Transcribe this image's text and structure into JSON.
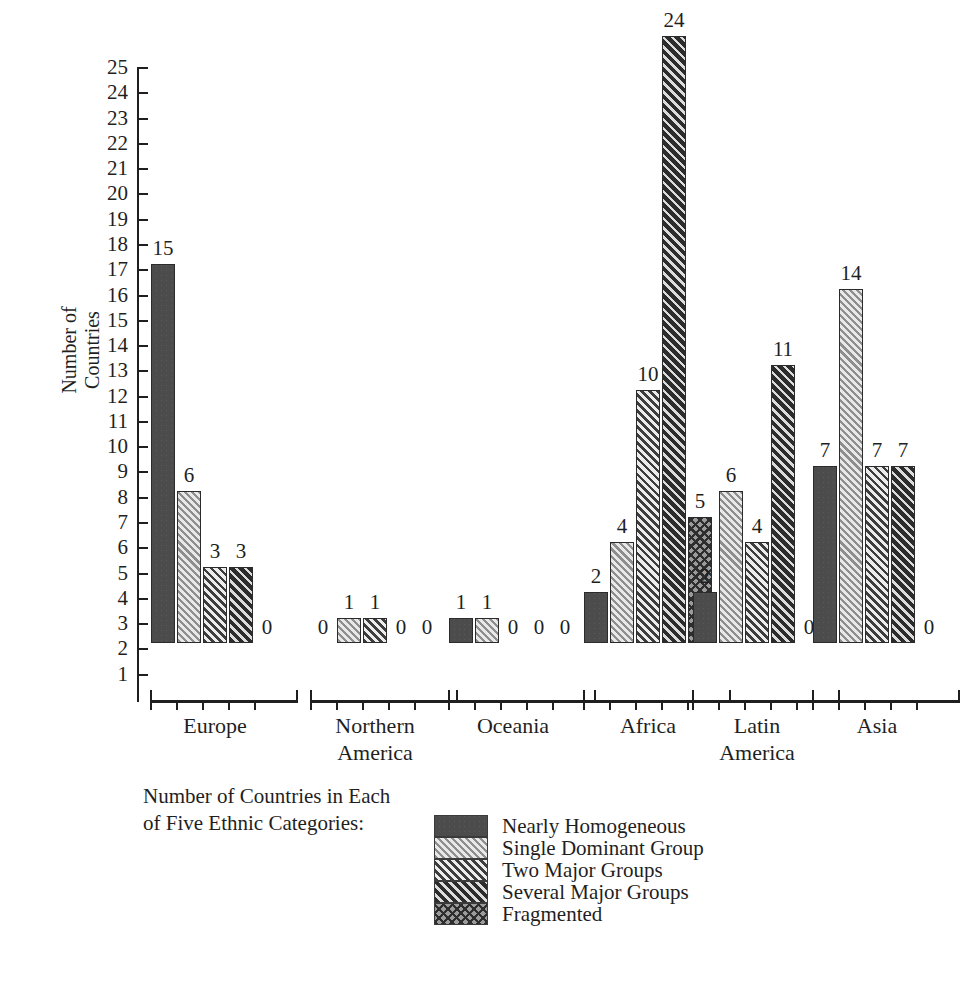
{
  "chart_data": {
    "type": "bar",
    "title": "Number of Countries in Each of Five Ethnic Categories:",
    "xlabel": "",
    "ylabel": "Number of\nCountries",
    "ylim": [
      0,
      25
    ],
    "ytick_step": 1,
    "grid": false,
    "legend_position": "bottom-center",
    "categories": [
      "Europe",
      "Northern\nAmerica",
      "Oceania",
      "Africa",
      "Latin\nAmerica",
      "Asia"
    ],
    "series": [
      {
        "name": "Nearly Homogeneous",
        "pattern": "solid",
        "values": [
          15,
          0,
          1,
          2,
          2,
          7
        ]
      },
      {
        "name": "Single Dominant Group",
        "pattern": "hatch-light",
        "values": [
          6,
          1,
          1,
          4,
          6,
          14
        ]
      },
      {
        "name": "Two Major Groups",
        "pattern": "hatch-mid",
        "values": [
          3,
          1,
          0,
          10,
          4,
          7
        ]
      },
      {
        "name": "Several Major Groups",
        "pattern": "hatch-dark",
        "values": [
          3,
          0,
          0,
          24,
          11,
          7
        ]
      },
      {
        "name": "Fragmented",
        "pattern": "cross",
        "values": [
          0,
          0,
          0,
          5,
          0,
          0
        ]
      }
    ],
    "ytick_labels": [
      "1",
      "2",
      "3",
      "4",
      "5",
      "6",
      "7",
      "8",
      "9",
      "10",
      "11",
      "12",
      "13",
      "14",
      "15",
      "16",
      "17",
      "18",
      "19",
      "20",
      "21",
      "22",
      "23",
      "24",
      "25"
    ],
    "colors": {
      "axis": "#1f1f1f",
      "text": "#1f1f1f",
      "background": "#ffffff",
      "nearly_homogeneous": "#4c4c4c",
      "single_dominant_group": "#d8d8d8",
      "two_major_groups": "#cfcfcf",
      "several_major_groups": "#6a6a6a",
      "fragmented": "#9a9a9a"
    }
  },
  "axis": {
    "y_title": "Number of\nCountries"
  },
  "caption": {
    "text": "Number of Countries in Each\nof Five Ethnic Categories:"
  },
  "legend": {
    "items": [
      {
        "label": "Nearly Homogeneous",
        "pattern": "solid"
      },
      {
        "label": "Single Dominant Group",
        "pattern": "hatch-light"
      },
      {
        "label": "Two Major Groups",
        "pattern": "hatch-mid"
      },
      {
        "label": "Several Major Groups",
        "pattern": "hatch-dark"
      },
      {
        "label": "Fragmented",
        "pattern": "cross"
      }
    ]
  }
}
